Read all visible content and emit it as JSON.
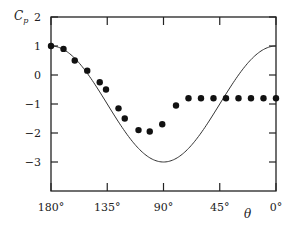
{
  "chart_data": {
    "type": "scatter",
    "title": "",
    "xlabel": "θ",
    "ylabel": "C_p",
    "ylabel_main": "C",
    "ylabel_sub": "p",
    "xlim": [
      180,
      0
    ],
    "ylim": [
      -4,
      2
    ],
    "x_reversed": true,
    "grid": false,
    "legend": "none",
    "x_ticks": [
      180,
      135,
      90,
      45,
      0
    ],
    "x_tick_labels": [
      "180°",
      "135°",
      "90°",
      "45°",
      "0°"
    ],
    "y_ticks": [
      2,
      1,
      0,
      -1,
      -2,
      -3
    ],
    "y_tick_labels": [
      "2",
      "1",
      "0",
      "−1",
      "−2",
      "−3"
    ],
    "series": [
      {
        "name": "theory",
        "kind": "line",
        "formula": "Cp = 1 - 4 sin^2(theta)",
        "x": [
          180,
          170,
          160,
          150,
          140,
          130,
          120,
          110,
          100,
          90,
          80,
          70,
          60,
          50,
          40,
          30,
          20,
          10,
          0
        ],
        "values": [
          1.0,
          0.88,
          0.53,
          0.0,
          -0.65,
          -1.35,
          -2.0,
          -2.53,
          -2.88,
          -3.0,
          -2.88,
          -2.53,
          -2.0,
          -1.35,
          -0.65,
          0.0,
          0.53,
          0.88,
          1.0
        ]
      },
      {
        "name": "experiment",
        "kind": "scatter",
        "x": [
          180,
          170,
          161,
          151,
          141,
          136,
          126,
          121,
          110,
          101,
          91,
          80,
          70,
          60,
          50,
          40,
          30,
          20,
          10,
          0
        ],
        "values": [
          1.0,
          0.9,
          0.5,
          0.15,
          -0.25,
          -0.5,
          -1.15,
          -1.5,
          -1.9,
          -1.95,
          -1.7,
          -1.05,
          -0.8,
          -0.8,
          -0.8,
          -0.8,
          -0.8,
          -0.8,
          -0.8,
          -0.8
        ]
      }
    ]
  },
  "colors": {
    "axis": "#222222",
    "curve": "#333333",
    "points": "#111111"
  }
}
